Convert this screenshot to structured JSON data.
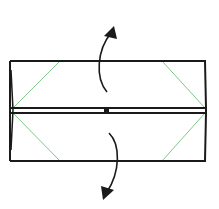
{
  "diagram": {
    "type": "origami-fold-step",
    "colors": {
      "outline": "#1a1a1a",
      "crease": "#7fc98a",
      "arrow": "#1a1a1a",
      "background": "#ffffff"
    },
    "shapes": {
      "rectangle": {
        "x1": 10,
        "y1": 61,
        "x2": 206,
        "y2": 161
      },
      "center_line_top_y": 108,
      "center_line_bottom_y": 113
    },
    "creases": [
      {
        "name": "top-left",
        "from": [
          60,
          61
        ],
        "to": [
          13,
          108
        ]
      },
      {
        "name": "top-right",
        "from": [
          162,
          61
        ],
        "to": [
          205,
          108
        ]
      },
      {
        "name": "bottom-left",
        "from": [
          13,
          113
        ],
        "to": [
          60,
          161
        ]
      },
      {
        "name": "bottom-right",
        "from": [
          205,
          113
        ],
        "to": [
          162,
          161
        ]
      }
    ],
    "arrows": [
      {
        "name": "unfold-up",
        "direction": "up"
      },
      {
        "name": "unfold-down",
        "direction": "down"
      }
    ]
  }
}
